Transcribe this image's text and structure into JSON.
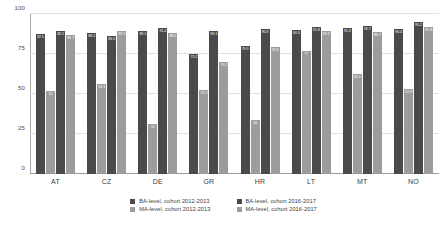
{
  "chart_data": {
    "type": "bar",
    "title": "",
    "xlabel": "",
    "ylabel": "",
    "ylim": [
      0,
      100
    ],
    "yticks": [
      0,
      25,
      50,
      75,
      100
    ],
    "grid": true,
    "legend_position": "bottom",
    "categories": [
      "AT",
      "CZ",
      "DE",
      "GR",
      "HR",
      "LT",
      "MT",
      "NO"
    ],
    "series": [
      {
        "name": "BA-level, cohort  2012-2013",
        "color": "#4a4a4a",
        "values": [
          87.5,
          88.2,
          89.1,
          75.2,
          79.9,
          90.3,
          91.3,
          90.4
        ]
      },
      {
        "name": "MA-level, cohort  2012-2013",
        "color": "#9c9c9c",
        "values": [
          52.0,
          56.1,
          31.0,
          52.2,
          34.0,
          77.0,
          62.6,
          52.9
        ]
      },
      {
        "name": "BA-level, cohort  2016-2017",
        "color": "#4a4a4a",
        "values": [
          89.2,
          86.5,
          91.4,
          89.1,
          90.9,
          91.8,
          92.7,
          95.2
        ]
      },
      {
        "name": "MA-level, cohort  2016-2017",
        "color": "#9c9c9c",
        "values": [
          86.7,
          89.3,
          88.2,
          70.1,
          79.6,
          89.2,
          88.7,
          91.8
        ]
      }
    ]
  },
  "axis": {
    "y_tick_labels": [
      "0",
      "25",
      "50",
      "75",
      "100"
    ]
  },
  "legend": {
    "items": [
      {
        "label": "BA-level, cohort  2012-2013"
      },
      {
        "label": "BA-level, cohort  2016-2017"
      },
      {
        "label": "MA-level, cohort  2012-2013"
      },
      {
        "label": "MA-level, cohort  2016-2017"
      }
    ]
  }
}
